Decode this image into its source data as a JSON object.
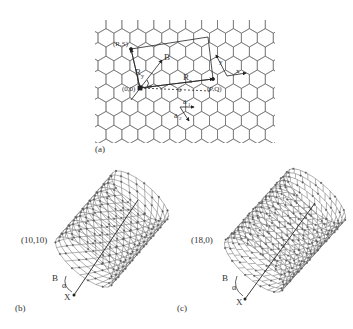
{
  "panel_a": {
    "caption": "(a)",
    "labels": {
      "origin": "(0,0)",
      "rs": "(R,S)",
      "pq": "(P,Q)",
      "B": "B",
      "Ry": "R",
      "Ry_sub": "y",
      "Rx": "R",
      "Rx_sub": "x",
      "alpha": "α",
      "theta": "θ",
      "a1": "a",
      "a1_sub": "1",
      "a2": "a",
      "a2_sub": "2",
      "x_axis": "x",
      "y_axis": "y"
    }
  },
  "panel_b": {
    "caption": "(b)",
    "chirality": "(10,10)",
    "B": "B",
    "alpha": "α",
    "X": "X"
  },
  "panel_c": {
    "caption": "(c)",
    "chirality": "(18,0)",
    "B": "B",
    "alpha": "α",
    "X": "X"
  },
  "colors": {
    "line": "#555555",
    "dark": "#222222"
  }
}
